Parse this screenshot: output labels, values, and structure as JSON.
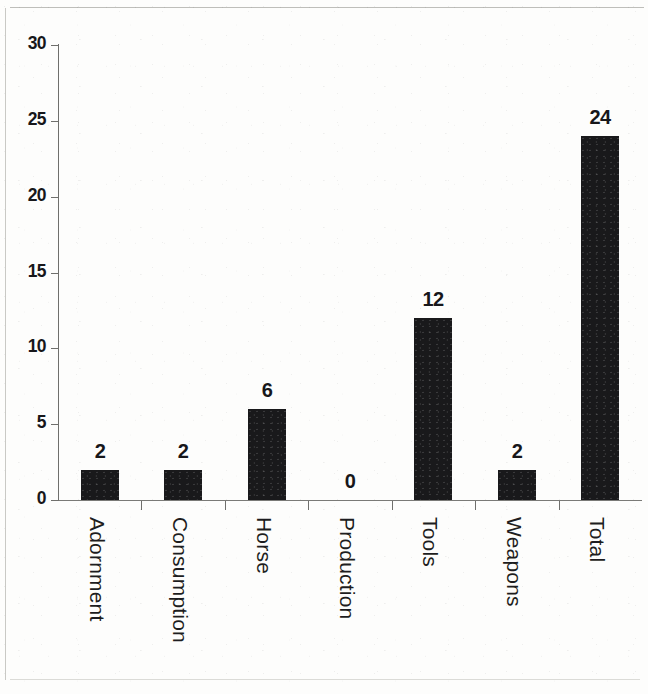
{
  "chart_data": {
    "type": "bar",
    "title": "",
    "subtitle": "",
    "xlabel": "",
    "ylabel": "",
    "categories": [
      "Adornment",
      "Consumption",
      "Horse",
      "Production",
      "Tools",
      "Weapons",
      "Total"
    ],
    "values": [
      2,
      2,
      6,
      0,
      12,
      2,
      24
    ],
    "value_labels": [
      "2",
      "2",
      "6",
      "0",
      "12",
      "2",
      "24"
    ],
    "ylim": [
      0,
      30
    ],
    "yticks": [
      0,
      5,
      10,
      15,
      20,
      25,
      30
    ],
    "ytick_labels": [
      "0",
      "5",
      "10",
      "15",
      "20",
      "25",
      "30"
    ],
    "grid": false,
    "legend": null,
    "bar_color": "#19191b",
    "axis_color": "#6f6f6c",
    "background_color": "#fdfdfc",
    "text_color": "#17171a",
    "xtick_label_rotation": 90
  }
}
